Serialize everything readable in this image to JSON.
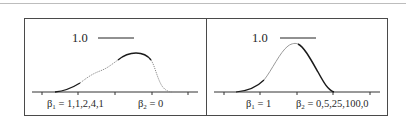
{
  "figure": {
    "top_rule": true,
    "panels": [
      {
        "id": "left",
        "scale_label": "1.0",
        "beta1_symbol": "β",
        "beta1_sub": "1",
        "beta1_value": "= 1,1,2,4,1",
        "beta2_symbol": "β",
        "beta2_sub": "2",
        "beta2_value": "= 0",
        "curve_description": "skewed unimodal density, peak right of center, solid/dotted segments"
      },
      {
        "id": "right",
        "scale_label": "1.0",
        "beta1_symbol": "β",
        "beta1_sub": "1",
        "beta1_value": "= 1",
        "beta2_symbol": "β",
        "beta2_sub": "2",
        "beta2_value": "= 0,5,25,100,0",
        "curve_description": "bell-shaped density, peak near center"
      }
    ],
    "colors": {
      "frame": "#4a4a4a",
      "curve_dark": "#1a1a1a",
      "curve_light": "#8a8a8a",
      "axis": "#333333",
      "rule": "#bdbdbd"
    }
  }
}
